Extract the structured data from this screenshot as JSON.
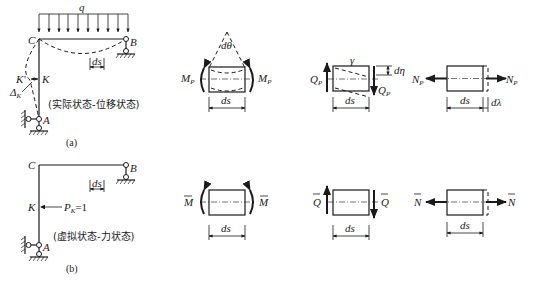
{
  "figure": {
    "panel_a": {
      "caption": "(a)",
      "state_label": "(实际状态-位移状态)",
      "load_label": "q",
      "nodes": {
        "C": "C",
        "B": "B",
        "K": "K",
        "K_prime": "K'",
        "A": "A"
      },
      "displacement_label": "Δ",
      "displacement_sub": "K",
      "ds_label": "ds"
    },
    "panel_b": {
      "caption": "(b)",
      "state_label": "(虚拟状态-力状态)",
      "nodes": {
        "C": "C",
        "B": "B",
        "K": "K",
        "A": "A"
      },
      "unit_load_label": "P",
      "unit_load_sub": "K",
      "unit_load_value": "=1",
      "ds_label": "ds"
    },
    "elements_real": {
      "moment": {
        "left": "M",
        "right": "M",
        "sub": "P",
        "angle_label": "dθ",
        "ds_label": "ds"
      },
      "shear": {
        "left": "Q",
        "right": "Q",
        "sub": "P",
        "angle_label": "γ",
        "dim_label": "dη",
        "ds_label": "ds"
      },
      "axial": {
        "left": "N",
        "right": "N",
        "sub": "P",
        "ds_label": "ds",
        "elong_label": "dλ"
      }
    },
    "elements_virtual": {
      "moment": {
        "left": "M",
        "right": "M",
        "ds_label": "ds"
      },
      "shear": {
        "left": "Q",
        "right": "Q",
        "ds_label": "ds"
      },
      "axial": {
        "left": "N",
        "right": "N",
        "ds_label": "ds"
      }
    }
  }
}
